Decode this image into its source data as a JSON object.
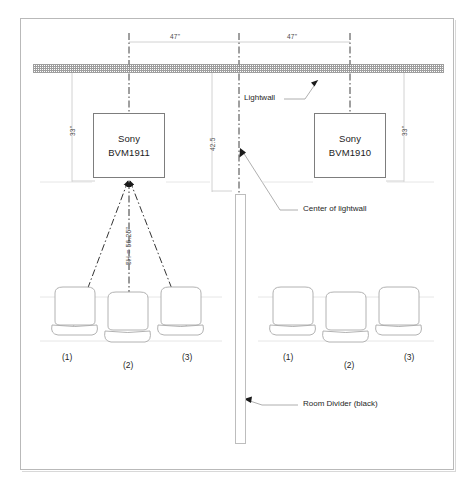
{
  "diagram": {
    "frame": {
      "visible": true
    },
    "lightwall": {
      "label": "Lightwall",
      "pattern": "stipple-gray"
    },
    "monitors": [
      {
        "id": "left",
        "brand": "Sony",
        "model": "BVM1911",
        "height_label": "33\""
      },
      {
        "id": "right",
        "brand": "Sony",
        "model": "BVM1910",
        "height_label": "33\""
      }
    ],
    "dimensions": {
      "left_span": "47\"",
      "right_span": "47\"",
      "center_vertical": "42.5",
      "left_drop": "33\"",
      "right_drop": "33\"",
      "viewing_distance": "5H = 56.25\""
    },
    "annotations": [
      {
        "name": "lightwall",
        "text": "Lightwall"
      },
      {
        "name": "center-of-lightwall",
        "text": "Center of lightwall"
      },
      {
        "name": "room-divider",
        "text": "Room Divider (black)"
      }
    ],
    "seating": {
      "left_group": [
        "(1)",
        "(2)",
        "(3)"
      ],
      "right_group": [
        "(1)",
        "(2)",
        "(3)"
      ]
    },
    "colors": {
      "line": "#2b2b2b",
      "thin_line": "#c6c6c6",
      "box_border": "#7d7d7d",
      "wall_fill": "#8e8e8e",
      "text": "#1f1f1f"
    }
  }
}
